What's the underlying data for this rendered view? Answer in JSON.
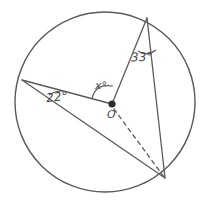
{
  "figure": {
    "type": "circle-geometry-diagram",
    "background_color": "#ffffff",
    "stroke_color": "#5a5a5a",
    "text_color": "#4a4a4a"
  },
  "circle": {
    "name": "main-circle",
    "center_x": 105,
    "center_y": 102,
    "radius": 90
  },
  "points": {
    "center": {
      "label": "O",
      "x": 112,
      "y": 104
    },
    "top": {
      "label": "",
      "x": 147,
      "y": 18
    },
    "left": {
      "label": "",
      "x": 22,
      "y": 80
    },
    "bottom_right": {
      "label": "",
      "x": 165,
      "y": 178
    }
  },
  "labels": {
    "angle_top": "33°",
    "angle_left": "22°",
    "angle_center": "x°",
    "center_point": "O"
  },
  "segments": [
    {
      "name": "top-to-center",
      "from": "top",
      "to": "center",
      "style": "solid"
    },
    {
      "name": "top-to-bottom-right",
      "from": "top",
      "to": "bottom_right",
      "style": "solid"
    },
    {
      "name": "left-to-center",
      "from": "left",
      "to": "center",
      "style": "solid"
    },
    {
      "name": "left-to-bottom-right",
      "from": "left",
      "to": "bottom_right",
      "style": "solid"
    },
    {
      "name": "center-to-bottom-right",
      "from": "center",
      "to": "bottom_right",
      "style": "dashed"
    }
  ]
}
